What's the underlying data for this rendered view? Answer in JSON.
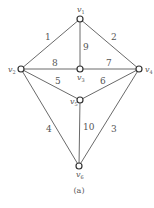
{
  "diagram": {
    "caption": "(a)",
    "nodes": [
      {
        "id": "v1",
        "label": "v",
        "sub": "1",
        "x": 80,
        "y": 19
      },
      {
        "id": "v2",
        "label": "v",
        "sub": "2",
        "x": 21,
        "y": 69
      },
      {
        "id": "v3",
        "label": "v",
        "sub": "3",
        "x": 80,
        "y": 69
      },
      {
        "id": "v4",
        "label": "v",
        "sub": "4",
        "x": 139,
        "y": 69
      },
      {
        "id": "v5",
        "label": "v",
        "sub": "5",
        "x": 80,
        "y": 100
      },
      {
        "id": "v6",
        "label": "v",
        "sub": "6",
        "x": 79,
        "y": 166
      }
    ],
    "edges": [
      {
        "from": "v1",
        "to": "v2",
        "weight": "1"
      },
      {
        "from": "v1",
        "to": "v4",
        "weight": "2"
      },
      {
        "from": "v4",
        "to": "v6",
        "weight": "3"
      },
      {
        "from": "v2",
        "to": "v6",
        "weight": "4"
      },
      {
        "from": "v2",
        "to": "v5",
        "weight": "5"
      },
      {
        "from": "v4",
        "to": "v5",
        "weight": "6"
      },
      {
        "from": "v3",
        "to": "v4",
        "weight": "7"
      },
      {
        "from": "v2",
        "to": "v3",
        "weight": "8"
      },
      {
        "from": "v1",
        "to": "v3",
        "weight": "9"
      },
      {
        "from": "v5",
        "to": "v6",
        "weight": "10"
      }
    ]
  }
}
